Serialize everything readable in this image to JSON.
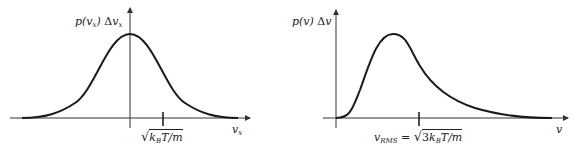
{
  "colors": {
    "curve": "#1a1a1a",
    "axis": "#333333",
    "background": "#ffffff"
  },
  "left_plot": {
    "name": "Maxwell velocity-component distribution",
    "y_label": {
      "p": "p(",
      "var": "v",
      "sub": "x",
      "close": ")",
      "delta": "Δ",
      "var2": "v",
      "sub2": "x"
    },
    "x_label": {
      "var": "v",
      "sub": "x"
    },
    "tick_label": {
      "sqrt": "√",
      "k": "k",
      "ksub": "B",
      "rest": "T/m"
    }
  },
  "right_plot": {
    "name": "Maxwell speed distribution",
    "y_label": {
      "p": "p(v)",
      "delta": "Δ",
      "var": "v"
    },
    "x_label": {
      "var": "v"
    },
    "tick_label": {
      "v": "v",
      "vsub": "RMS",
      "eq": " = ",
      "sqrt": "√",
      "coef": "3",
      "k": "k",
      "ksub": "B",
      "rest": "T/m"
    }
  }
}
